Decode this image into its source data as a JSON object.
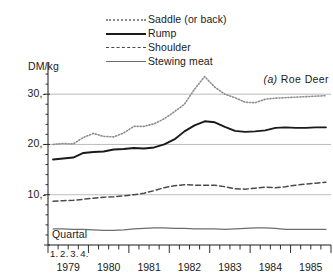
{
  "chart_data": {
    "type": "line",
    "panel_tag": "(a)",
    "panel_name": "Roe Deer",
    "ylabel": "DM/kg",
    "xlabel": "Quartal",
    "ylim": [
      0,
      36
    ],
    "ytick_labels": [
      "30,-",
      "20,-",
      "10,-"
    ],
    "ytick_values": [
      30,
      20,
      10
    ],
    "grid": true,
    "grid_axis": "y",
    "legend_position": "top-center",
    "x_axis_type": "quarterly",
    "quarter_labels": [
      "1.",
      "2.",
      "3.",
      "4."
    ],
    "year_labels": [
      "1979",
      "1980",
      "1981",
      "1982",
      "1983",
      "1984",
      "1985"
    ],
    "x_quarters": [
      "1979Q1",
      "1979Q2",
      "1979Q3",
      "1979Q4",
      "1980Q1",
      "1980Q2",
      "1980Q3",
      "1980Q4",
      "1981Q1",
      "1981Q2",
      "1981Q3",
      "1981Q4",
      "1982Q1",
      "1982Q2",
      "1982Q3",
      "1982Q4",
      "1983Q1",
      "1983Q2",
      "1983Q3",
      "1983Q4",
      "1984Q1",
      "1984Q2",
      "1984Q3",
      "1984Q4",
      "1985Q1",
      "1985Q2",
      "1985Q3",
      "1985Q4"
    ],
    "series": [
      {
        "name": "Saddle (or back)",
        "style": "dotted",
        "color": "#8d8d8d",
        "values": [
          20.0,
          20.2,
          20.1,
          21.4,
          22.2,
          21.6,
          21.5,
          22.3,
          23.6,
          23.6,
          24.1,
          25.1,
          26.5,
          28.0,
          31.0,
          33.5,
          31.4,
          30.0,
          29.3,
          28.4,
          28.3,
          29.0,
          29.2,
          29.3,
          29.4,
          29.5,
          29.6,
          29.7
        ]
      },
      {
        "name": "Rump",
        "style": "solid-bold",
        "color": "#1a1a1a",
        "values": [
          17.0,
          17.2,
          17.4,
          18.3,
          18.5,
          18.6,
          19.0,
          19.1,
          19.3,
          19.2,
          19.4,
          20.0,
          21.0,
          22.6,
          23.8,
          24.6,
          24.4,
          23.5,
          22.7,
          22.5,
          22.6,
          22.8,
          23.3,
          23.4,
          23.3,
          23.3,
          23.4,
          23.4
        ]
      },
      {
        "name": "Shoulder",
        "style": "dashed",
        "color": "#4a4a4a",
        "values": [
          8.7,
          8.8,
          8.9,
          9.1,
          9.3,
          9.5,
          9.6,
          9.8,
          10.0,
          10.3,
          10.8,
          11.4,
          11.8,
          12.0,
          11.9,
          11.9,
          11.9,
          11.6,
          11.2,
          11.1,
          11.3,
          11.5,
          11.4,
          11.6,
          11.9,
          12.1,
          12.3,
          12.5
        ]
      },
      {
        "name": "Stewing meat",
        "style": "solid-thin",
        "color": "#6d6d6d",
        "values": [
          3.2,
          3.2,
          3.1,
          3.1,
          3.0,
          2.9,
          2.9,
          3.0,
          3.2,
          3.3,
          3.4,
          3.4,
          3.3,
          3.3,
          3.2,
          3.2,
          3.2,
          3.1,
          3.2,
          3.3,
          3.4,
          3.4,
          3.3,
          3.1,
          3.1,
          3.1,
          3.1,
          3.1
        ]
      }
    ]
  },
  "legend": {
    "items": [
      {
        "label": "Saddle (or back)",
        "style": "saddle"
      },
      {
        "label": "Rump",
        "style": "rump"
      },
      {
        "label": "Shoulder",
        "style": "shoulder"
      },
      {
        "label": "Stewing meat",
        "style": "stewing"
      }
    ]
  },
  "colors": {
    "axis": "#1a1a1a",
    "grid": "#b4b4b4",
    "background": "#ffffff"
  }
}
